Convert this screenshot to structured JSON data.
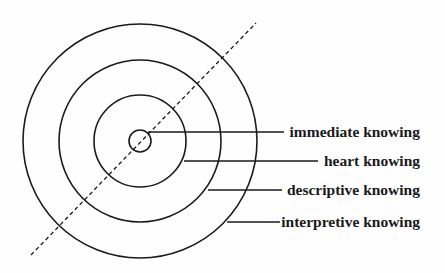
{
  "diagram": {
    "type": "concentric-circles",
    "center": [
      140,
      140
    ],
    "rings": [
      {
        "name": "immediate knowing",
        "radius": 11
      },
      {
        "name": "heart knowing",
        "radius": 46
      },
      {
        "name": "descriptive knowing",
        "radius": 80
      },
      {
        "name": "interpretive knowing",
        "radius": 116
      }
    ],
    "axis": {
      "style": "dashed",
      "from": [
        31,
        255
      ],
      "to": [
        255,
        23
      ]
    }
  },
  "labels": {
    "immediate": "immediate knowing",
    "heart": "heart knowing",
    "descriptive": "descriptive knowing",
    "interpretive": "interpretive knowing"
  }
}
